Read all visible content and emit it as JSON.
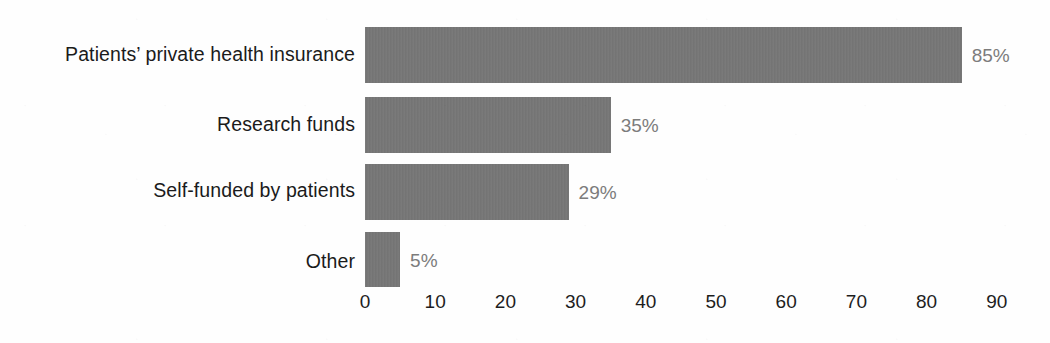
{
  "chart_data": {
    "type": "bar",
    "orientation": "horizontal",
    "title": "",
    "subtitle": "",
    "xlabel": "",
    "ylabel": "",
    "categories": [
      "Patients’ private health insurance",
      "Research funds",
      "Self-funded by patients",
      "Other"
    ],
    "values": [
      85,
      35,
      29,
      5
    ],
    "value_labels": [
      "85%",
      "35%",
      "29%",
      "5%"
    ],
    "xlim": [
      0,
      90
    ],
    "xticks": [
      0,
      10,
      20,
      30,
      40,
      50,
      60,
      70,
      80,
      90
    ],
    "xtick_labels": [
      "0",
      "10",
      "20",
      "30",
      "40",
      "50",
      "60",
      "70",
      "80",
      "90"
    ],
    "grid": false,
    "legend": false,
    "legend_position": "none",
    "bar_color": "#767676",
    "value_label_color": "#7c7c7c",
    "category_label_color": "#1b1b1b",
    "axis_label_color": "#1d1d1d",
    "background_color": "#fefefe"
  }
}
